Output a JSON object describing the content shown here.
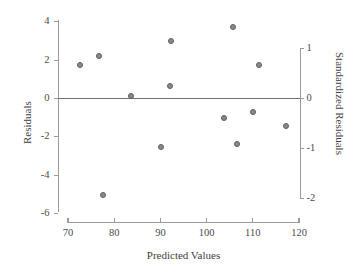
{
  "chart_data": {
    "type": "scatter",
    "title": "",
    "xlabel": "Predicted Values",
    "ylabel": "Residuals",
    "ylabel_right": "Standardized Residuals",
    "xlim": [
      68,
      121
    ],
    "ylim": [
      -6.6,
      4.4
    ],
    "ylim_right": [
      -2.58,
      1.72
    ],
    "xticks": [
      70,
      80,
      90,
      100,
      110,
      120
    ],
    "xtick_labels": [
      "70",
      "80",
      "90",
      "100",
      "110",
      "120"
    ],
    "yticks": [
      4,
      2,
      0,
      -2,
      -4,
      -6
    ],
    "ytick_labels": [
      "4",
      "2",
      "0",
      "-2",
      "-4",
      "-6"
    ],
    "yticks_right": [
      1,
      0,
      -1,
      -2
    ],
    "ytick_labels_right": [
      "1",
      "0",
      "-1",
      "-2"
    ],
    "grid": false,
    "legend": null,
    "reference_line": {
      "type": "horizontal",
      "y": 0,
      "color": "#6f6f6f"
    },
    "series": [
      {
        "name": "residuals",
        "marker": "circle",
        "color": "#8a8a8a",
        "edge_color": "#5d5d5d",
        "points": [
          {
            "x": 72.6,
            "y": 1.75
          },
          {
            "x": 76.7,
            "y": 2.2
          },
          {
            "x": 77.6,
            "y": -5.0
          },
          {
            "x": 83.7,
            "y": 0.15
          },
          {
            "x": 90.1,
            "y": -2.5
          },
          {
            "x": 92.0,
            "y": 0.65
          },
          {
            "x": 92.4,
            "y": 3.0
          },
          {
            "x": 103.7,
            "y": -1.0
          },
          {
            "x": 105.7,
            "y": 3.75
          },
          {
            "x": 106.6,
            "y": -2.35
          },
          {
            "x": 110.0,
            "y": -0.7
          },
          {
            "x": 111.4,
            "y": 1.75
          },
          {
            "x": 117.2,
            "y": -1.45
          }
        ]
      }
    ]
  },
  "axes": {
    "left_title": "Residuals",
    "right_title": "Standardized Residuals",
    "bottom_title": "Predicted Values"
  }
}
